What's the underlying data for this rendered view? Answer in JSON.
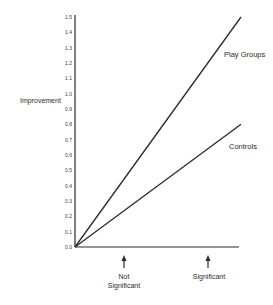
{
  "chart_data": {
    "type": "line",
    "title": "",
    "xlabel": "",
    "ylabel": "Improvement",
    "ylim": [
      0.0,
      1.5
    ],
    "xlim": [
      0,
      1
    ],
    "y_ticks": [
      "0.0",
      "0.1",
      "0.2",
      "0.3",
      "0.4",
      "0.5",
      "0.6",
      "0.7",
      "0.8",
      "0.9",
      "1.0",
      "1.1",
      "1.2",
      "1.3",
      "1.4",
      "1.5"
    ],
    "grid": false,
    "legend": "inline labels at line ends",
    "series": [
      {
        "name": "Play Groups",
        "x": [
          0,
          1
        ],
        "values": [
          0.0,
          1.5
        ]
      },
      {
        "name": "Controls",
        "x": [
          0,
          1
        ],
        "values": [
          0.0,
          0.8
        ]
      }
    ],
    "annotations": [
      {
        "text": "Not Significant",
        "lines": [
          "Not",
          "Significant"
        ],
        "x": 0.3,
        "type": "up-arrow below x-axis"
      },
      {
        "text": "Significant",
        "lines": [
          "Significant"
        ],
        "x": 0.82,
        "type": "up-arrow below x-axis"
      }
    ]
  },
  "labels": {
    "ylabel": "Improvement",
    "play_groups": "Play Groups",
    "controls": "Controls",
    "not_sig_line1": "Not",
    "not_sig_line2": "Significant",
    "sig": "Significant"
  },
  "colors": {
    "line": "#2a2a2a",
    "axis": "#2a2a2a",
    "background": "#ffffff"
  }
}
